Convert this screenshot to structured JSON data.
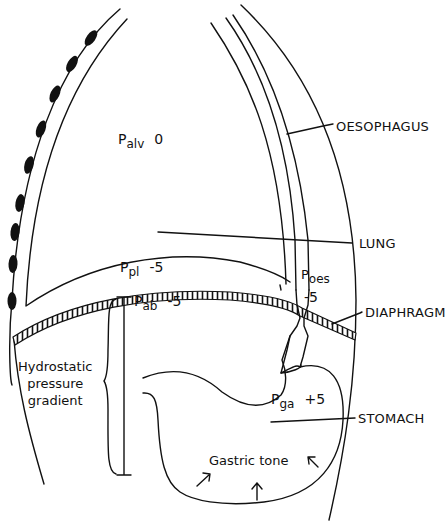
{
  "diagram": {
    "stroke_color": "#111111",
    "background": "#ffffff",
    "structure_labels": {
      "oesophagus": "OESOPHAGUS",
      "lung": "LUNG",
      "diaphragm": "DIAPHRAGM",
      "stomach": "STOMACH"
    },
    "pressures": {
      "alveolar": {
        "symbol": "P",
        "sub": "alv",
        "value": "0"
      },
      "pleural": {
        "symbol": "P",
        "sub": "pl",
        "value": "-5"
      },
      "abdominal": {
        "symbol": "P",
        "sub": "ab",
        "value": "-5"
      },
      "oesophageal": {
        "symbol": "P",
        "sub": "oes",
        "value": "-5"
      },
      "gastric": {
        "symbol": "P",
        "sub": "ga",
        "value": "+5"
      }
    },
    "annotations": {
      "hydrostatic_line1": "Hydrostatic",
      "hydrostatic_line2": "pressure",
      "hydrostatic_line3": "gradient",
      "gastric_tone": "Gastric tone"
    }
  }
}
